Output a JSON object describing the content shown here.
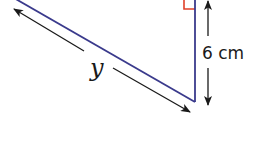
{
  "diagram": {
    "type": "right-triangle-fragment",
    "labels": {
      "hypotenuse": "y",
      "vertical_side": "6 cm"
    },
    "colors": {
      "triangle_edge": "#3a3a8c",
      "right_angle_marker": "#e0402a",
      "dimension_arrow": "#1a1a1a",
      "background": "#ffffff"
    },
    "right_angle": true
  }
}
